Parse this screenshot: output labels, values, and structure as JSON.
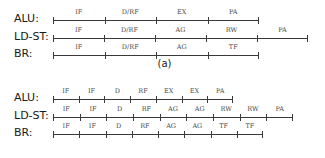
{
  "figure": {
    "axis_origin_x": 53,
    "rows_labels": [
      "ALU:",
      "LD-ST:",
      "BR:"
    ]
  },
  "panels": [
    {
      "id": "a",
      "caption": "(a)",
      "tick_spacing": 51.5,
      "rows": [
        {
          "label": "ALU:",
          "stages": [
            "IF",
            "D/RF",
            "EX",
            "PA"
          ],
          "tick_count": 5,
          "start_x": 53,
          "end_x": 259
        },
        {
          "label": "LD-ST:",
          "stages": [
            "IF",
            "D/RF",
            "AG",
            "RW",
            "PA"
          ],
          "tick_count": 6,
          "start_x": 53,
          "end_x": 308
        },
        {
          "label": "BR:",
          "stages": [
            "IF",
            "D/RF",
            "AG",
            "TF"
          ],
          "tick_count": 5,
          "start_x": 53,
          "end_x": 259
        }
      ]
    },
    {
      "id": "b",
      "caption": "(b)",
      "tick_spacing": 30,
      "rows": [
        {
          "label": "ALU:",
          "stages": [
            "IF",
            "IF",
            "D",
            "RF",
            "EX",
            "EX",
            "PA"
          ],
          "tick_count": 8,
          "start_x": 53,
          "end_x": 233
        },
        {
          "label": "LD-ST:",
          "stages": [
            "IF",
            "IF",
            "D",
            "RF",
            "AG",
            "AG",
            "RW",
            "RW",
            "PA"
          ],
          "tick_count": 10,
          "start_x": 53,
          "end_x": 293
        },
        {
          "label": "BR:",
          "stages": [
            "IF",
            "IF",
            "D",
            "RF",
            "AG",
            "AG",
            "TF",
            "TF"
          ],
          "tick_count": 9,
          "start_x": 53,
          "end_x": 263
        }
      ]
    }
  ],
  "colors": {
    "line": "#3a3a3a",
    "stage_text": "#4a4a4a",
    "label_text": "#1a1a1a",
    "background": "#ffffff"
  }
}
